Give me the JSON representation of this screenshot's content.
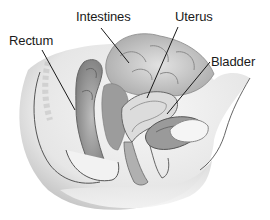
{
  "figure": {
    "labels": [
      {
        "id": "intestines",
        "text": "Intestines",
        "x": 76,
        "y": 10,
        "line": [
          101,
          28,
          129,
          63
        ]
      },
      {
        "id": "uterus",
        "text": "Uterus",
        "x": 175,
        "y": 10,
        "line": [
          178,
          27,
          147,
          98
        ]
      },
      {
        "id": "rectum",
        "text": "Rectum",
        "x": 9,
        "y": 34,
        "line": [
          42,
          50,
          75,
          110
        ]
      },
      {
        "id": "bladder",
        "text": "Bladder",
        "x": 211,
        "y": 55,
        "line": [
          210,
          62,
          167,
          114
        ]
      }
    ],
    "colors": {
      "background": "#ffffff",
      "label_text": "#1a1a1a",
      "leader_line": "#1a1a1a",
      "tissue_light": "#f1f1f1",
      "tissue_mid": "#cfcfcf",
      "tissue_dark": "#8f8f8f",
      "outline": "#555555"
    }
  }
}
